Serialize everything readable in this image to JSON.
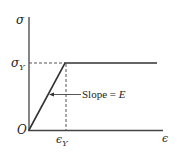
{
  "diagram": {
    "type": "stress-strain elastic-perfectly-plastic",
    "y_axis_label": "σ",
    "x_axis_label": "ϵ",
    "origin_label": "O",
    "yield_stress_label": "σ",
    "yield_stress_subscript": "Y",
    "yield_strain_label": "ϵ",
    "yield_strain_subscript": "Y",
    "slope_text": "Slope = ",
    "slope_symbol": "E",
    "line_color": "#333333"
  }
}
